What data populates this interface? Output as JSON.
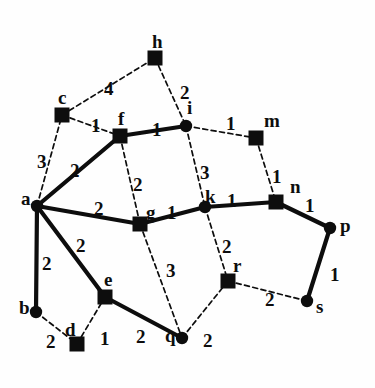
{
  "figure": {
    "background_color": "#fefefe",
    "ink_color": "#0d0d0d",
    "width": 375,
    "height": 388
  },
  "chart_data": {
    "type": "diagram",
    "subtype": "node-link-graph",
    "title": "",
    "directed": false,
    "weighted": true,
    "node_count": 16,
    "edge_count": 22,
    "node_shapes": {
      "square": "filled black square marker",
      "circle": "filled black round marker"
    },
    "edge_styles": {
      "solid": "thick solid line (tree / selected edge)",
      "dashed": "thin dashed line (non-tree edge)"
    },
    "nodes": [
      {
        "id": "h",
        "label": "h",
        "shape": "square",
        "x": 155,
        "y": 58,
        "label_dx": -3,
        "label_dy": -26
      },
      {
        "id": "c",
        "label": "c",
        "shape": "square",
        "x": 62,
        "y": 115,
        "label_dx": -4,
        "label_dy": -27
      },
      {
        "id": "f",
        "label": "f",
        "shape": "square",
        "x": 120,
        "y": 136,
        "label_dx": -2,
        "label_dy": -27
      },
      {
        "id": "i",
        "label": "i",
        "shape": "circle",
        "x": 186,
        "y": 126,
        "label_dx": 1,
        "label_dy": -28
      },
      {
        "id": "m",
        "label": "m",
        "shape": "square",
        "x": 256,
        "y": 138,
        "label_dx": 8,
        "label_dy": -27
      },
      {
        "id": "a",
        "label": "a",
        "shape": "circle",
        "x": 37,
        "y": 206,
        "label_dx": -16,
        "label_dy": -17
      },
      {
        "id": "g",
        "label": "g",
        "shape": "square",
        "x": 140,
        "y": 224,
        "label_dx": 6,
        "label_dy": -21
      },
      {
        "id": "k",
        "label": "k",
        "shape": "circle",
        "x": 205,
        "y": 207,
        "label_dx": 0,
        "label_dy": -20
      },
      {
        "id": "n",
        "label": "n",
        "shape": "square",
        "x": 276,
        "y": 202,
        "label_dx": 14,
        "label_dy": -25
      },
      {
        "id": "p",
        "label": "p",
        "shape": "circle",
        "x": 330,
        "y": 228,
        "label_dx": 10,
        "label_dy": -12
      },
      {
        "id": "b",
        "label": "b",
        "shape": "circle",
        "x": 36,
        "y": 312,
        "label_dx": -17,
        "label_dy": -14
      },
      {
        "id": "e",
        "label": "e",
        "shape": "square",
        "x": 105,
        "y": 297,
        "label_dx": -1,
        "label_dy": -27
      },
      {
        "id": "d",
        "label": "d",
        "shape": "square",
        "x": 77,
        "y": 344,
        "label_dx": -12,
        "label_dy": -24
      },
      {
        "id": "q",
        "label": "q",
        "shape": "circle",
        "x": 182,
        "y": 338,
        "label_dx": -17,
        "label_dy": -12
      },
      {
        "id": "r",
        "label": "r",
        "shape": "square",
        "x": 228,
        "y": 281,
        "label_dx": 5,
        "label_dy": -25
      },
      {
        "id": "s",
        "label": "s",
        "shape": "circle",
        "x": 307,
        "y": 301,
        "label_dx": 9,
        "label_dy": -4
      }
    ],
    "edges": [
      {
        "source": "c",
        "target": "h",
        "weight": 4,
        "style": "dashed",
        "label_x": 104,
        "label_y": 79
      },
      {
        "source": "h",
        "target": "i",
        "weight": 2,
        "style": "dashed",
        "label_x": 180,
        "label_y": 83
      },
      {
        "source": "c",
        "target": "f",
        "weight": 1,
        "style": "dashed",
        "label_x": 91,
        "label_y": 116
      },
      {
        "source": "f",
        "target": "i",
        "weight": 1,
        "style": "solid",
        "label_x": 152,
        "label_y": 120
      },
      {
        "source": "i",
        "target": "m",
        "weight": 1,
        "style": "dashed",
        "label_x": 226,
        "label_y": 114
      },
      {
        "source": "a",
        "target": "c",
        "weight": 3,
        "style": "dashed",
        "label_x": 37,
        "label_y": 152
      },
      {
        "source": "a",
        "target": "f",
        "weight": 2,
        "style": "solid",
        "label_x": 70,
        "label_y": 161
      },
      {
        "source": "f",
        "target": "g",
        "weight": 2,
        "style": "dashed",
        "label_x": 133,
        "label_y": 175
      },
      {
        "source": "i",
        "target": "k",
        "weight": 3,
        "style": "dashed",
        "label_x": 200,
        "label_y": 163
      },
      {
        "source": "m",
        "target": "n",
        "weight": 1,
        "style": "dashed",
        "label_x": 272,
        "label_y": 167
      },
      {
        "source": "a",
        "target": "g",
        "weight": 2,
        "style": "solid",
        "label_x": 94,
        "label_y": 199
      },
      {
        "source": "g",
        "target": "k",
        "weight": 1,
        "style": "solid",
        "label_x": 167,
        "label_y": 203
      },
      {
        "source": "k",
        "target": "n",
        "weight": 1,
        "style": "solid",
        "label_x": 227,
        "label_y": 191
      },
      {
        "source": "n",
        "target": "p",
        "weight": 1,
        "style": "solid",
        "label_x": 305,
        "label_y": 196
      },
      {
        "source": "a",
        "target": "b",
        "weight": 2,
        "style": "solid",
        "label_x": 42,
        "label_y": 254
      },
      {
        "source": "a",
        "target": "e",
        "weight": 2,
        "style": "solid",
        "label_x": 76,
        "label_y": 236
      },
      {
        "source": "k",
        "target": "r",
        "weight": 2,
        "style": "dashed",
        "label_x": 222,
        "label_y": 237
      },
      {
        "source": "g",
        "target": "q",
        "weight": 3,
        "style": "dashed",
        "label_x": 166,
        "label_y": 261
      },
      {
        "source": "p",
        "target": "s",
        "weight": 1,
        "style": "solid",
        "label_x": 330,
        "label_y": 265
      },
      {
        "source": "r",
        "target": "s",
        "weight": 2,
        "style": "dashed",
        "label_x": 265,
        "label_y": 290
      },
      {
        "source": "b",
        "target": "d",
        "weight": 2,
        "style": "dashed",
        "label_x": 46,
        "label_y": 332
      },
      {
        "source": "d",
        "target": "e",
        "weight": 1,
        "style": "dashed",
        "label_x": 100,
        "label_y": 329
      },
      {
        "source": "e",
        "target": "q",
        "weight": 2,
        "style": "solid",
        "label_x": 136,
        "label_y": 327
      },
      {
        "source": "q",
        "target": "r",
        "weight": 2,
        "style": "dashed",
        "label_x": 203,
        "label_y": 331
      }
    ]
  }
}
